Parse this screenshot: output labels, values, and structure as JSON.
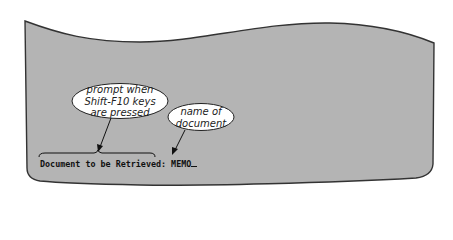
{
  "screen": {
    "background_color": "#b4b4b4",
    "border_color": "#333333",
    "prompt_label": "Document to be Retrieved:",
    "entered_value": "MEMO",
    "cursor": "_"
  },
  "callouts": [
    {
      "id": "prompt-callout",
      "lines": [
        "prompt when",
        "Shift-F10 keys",
        "are pressed"
      ],
      "points_to": "prompt_label"
    },
    {
      "id": "name-callout",
      "lines": [
        "name of",
        "document"
      ],
      "points_to": "entered_value"
    }
  ]
}
